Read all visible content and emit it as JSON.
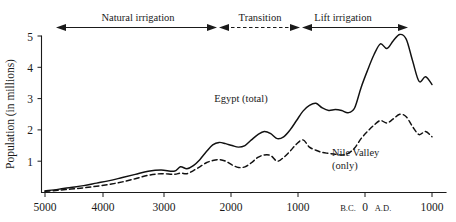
{
  "chart_data": {
    "type": "line",
    "title": "",
    "xlabel": "",
    "ylabel": "Population (in millions)",
    "xlim": [
      -5000,
      1000
    ],
    "ylim": [
      0,
      5
    ],
    "grid": false,
    "legend_position": "inline-annotations",
    "x_tick_labels": [
      "5000",
      "4000",
      "3000",
      "2000",
      "1000",
      "B.C.",
      "0",
      "A.D.",
      "1000"
    ],
    "x_tick_values": [
      -5000,
      -4000,
      -3000,
      -2000,
      -1000,
      -250,
      0,
      250,
      1000
    ],
    "y_tick_labels": [
      "1",
      "2",
      "3",
      "4",
      "5"
    ],
    "y_tick_values": [
      1,
      2,
      3,
      4,
      5
    ],
    "x": [
      -5000,
      -4800,
      -4600,
      -4400,
      -4200,
      -4000,
      -3800,
      -3600,
      -3400,
      -3200,
      -3000,
      -2900,
      -2800,
      -2700,
      -2600,
      -2500,
      -2400,
      -2300,
      -2200,
      -2100,
      -2000,
      -1900,
      -1800,
      -1700,
      -1600,
      -1500,
      -1400,
      -1300,
      -1200,
      -1100,
      -1000,
      -900,
      -800,
      -700,
      -600,
      -500,
      -400,
      -300,
      -200,
      -100,
      0,
      100,
      200,
      300,
      400,
      500,
      600,
      700,
      800,
      900,
      1000
    ],
    "series": [
      {
        "name": "Egypt (total)",
        "style": "solid",
        "values": [
          0.05,
          0.1,
          0.16,
          0.22,
          0.3,
          0.38,
          0.48,
          0.58,
          0.68,
          0.72,
          0.68,
          0.82,
          0.76,
          0.86,
          1.05,
          1.3,
          1.52,
          1.6,
          1.56,
          1.5,
          1.45,
          1.5,
          1.68,
          1.85,
          1.95,
          1.88,
          1.72,
          1.78,
          2.0,
          2.3,
          2.6,
          2.78,
          2.85,
          2.7,
          2.62,
          2.65,
          2.62,
          2.55,
          2.7,
          3.35,
          3.9,
          4.4,
          4.75,
          4.6,
          4.85,
          5.05,
          4.9,
          4.2,
          3.55,
          3.7,
          3.45
        ]
      },
      {
        "name": "Nile Valley (only)",
        "style": "dashed",
        "values": [
          0.04,
          0.07,
          0.11,
          0.15,
          0.2,
          0.26,
          0.34,
          0.44,
          0.55,
          0.6,
          0.58,
          0.62,
          0.6,
          0.7,
          0.82,
          0.95,
          1.02,
          1.05,
          1.0,
          0.88,
          0.8,
          0.82,
          0.95,
          1.12,
          1.2,
          1.18,
          1.0,
          1.12,
          1.32,
          1.55,
          1.68,
          1.45,
          1.35,
          1.28,
          1.25,
          1.22,
          1.2,
          1.25,
          1.42,
          1.72,
          1.95,
          2.15,
          2.3,
          2.22,
          2.35,
          2.5,
          2.42,
          2.1,
          1.85,
          1.95,
          1.78
        ]
      }
    ],
    "annotations": [
      {
        "text": "Natural irrigation",
        "type": "period-bracket",
        "from": -5000,
        "to": -2400,
        "arrow": "double",
        "style": "solid"
      },
      {
        "text": "Transition",
        "type": "period-bracket",
        "from": -2400,
        "to": -1100,
        "arrow": "double",
        "style": "dashed"
      },
      {
        "text": "Lift irrigation",
        "type": "period-bracket",
        "from": -1100,
        "to": 650,
        "arrow": "double",
        "style": "solid"
      },
      {
        "text": "Egypt (total)",
        "type": "series-label"
      },
      {
        "text": "Nile Valley",
        "type": "series-label"
      },
      {
        "text": "(only)",
        "type": "series-label"
      }
    ]
  },
  "axis": {
    "y_title": "Population (in millions)",
    "y_ticks": [
      "5",
      "4",
      "3",
      "2",
      "1"
    ],
    "x_ticks": [
      "5000",
      "4000",
      "3000",
      "2000",
      "1000",
      "B.C.",
      "0",
      "A.D.",
      "1000"
    ]
  },
  "periods": {
    "natural": "Natural irrigation",
    "transition": "Transition",
    "lift": "Lift irrigation"
  },
  "series_labels": {
    "egypt": "Egypt (total)",
    "nile_line1": "Nile Valley",
    "nile_line2": "(only)"
  },
  "colors": {
    "ink": "#111111",
    "background": "#ffffff"
  }
}
